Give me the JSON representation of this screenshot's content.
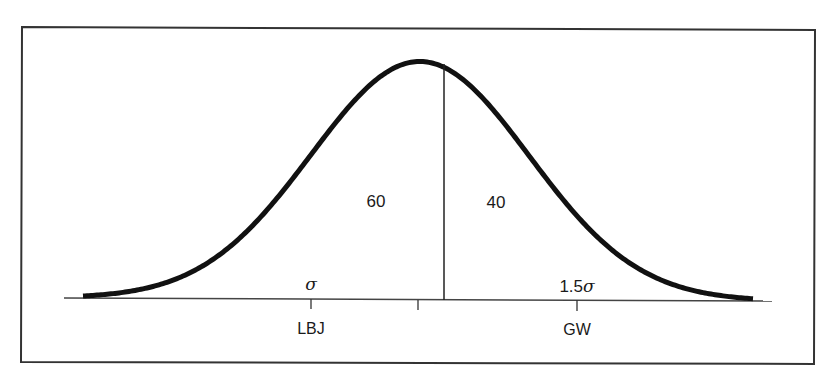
{
  "figure": {
    "type": "normal-distribution-diagram",
    "frame_color": "#333333",
    "curve_color": "#111111",
    "regions": {
      "left_area_label": "60",
      "right_area_label": "40"
    },
    "axis": {
      "ticks": [
        {
          "name": "LBJ",
          "label": "LBJ",
          "sigma_label": "σ"
        },
        {
          "name": "mean",
          "label": ""
        },
        {
          "name": "GW",
          "label": "GW",
          "sigma_label": "1.5σ"
        }
      ]
    },
    "annotations": {
      "lbj_sigma": "σ",
      "gw_sigma_prefix": "1.5",
      "gw_sigma_symbol": "σ",
      "lbj_label": "LBJ",
      "gw_label": "GW"
    }
  }
}
